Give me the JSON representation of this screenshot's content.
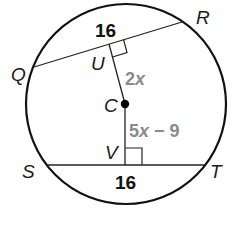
{
  "diagram": {
    "circle": {
      "center_label": "C"
    },
    "points": {
      "Q": "Q",
      "R": "R",
      "S": "S",
      "T": "T",
      "U": "U",
      "V": "V",
      "C": "C"
    },
    "chords": [
      {
        "name": "QR",
        "length_label": "16"
      },
      {
        "name": "ST",
        "length_label": "16"
      }
    ],
    "segments": [
      {
        "name": "CU",
        "expr_coef": "2",
        "expr_var": "x",
        "expr_rest": ""
      },
      {
        "name": "CV",
        "expr_coef": "5",
        "expr_var": "x",
        "expr_rest": " − 9"
      }
    ],
    "colors": {
      "stroke": "#111111",
      "expression": "#8a8a8a"
    }
  }
}
